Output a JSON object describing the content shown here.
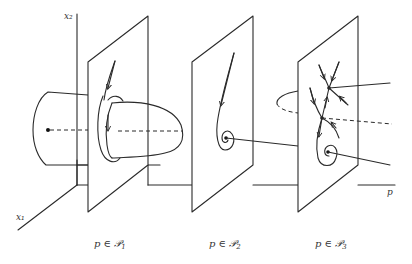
{
  "figure": {
    "type": "bifurcation-diagram",
    "axes": {
      "vertical": "x₂",
      "depth": "x₁",
      "horizontal": "p"
    },
    "panels": [
      {
        "id": "P1",
        "caption_prefix": "p ∈ ",
        "caption_set": "𝒫",
        "caption_sub": "1",
        "description": "Stable limit cycle surrounding equilibrium; paraboloid of periodic orbits"
      },
      {
        "id": "P2",
        "caption_prefix": "p ∈ ",
        "caption_set": "𝒫",
        "caption_sub": "2",
        "description": "Stable focus (spiral sink)"
      },
      {
        "id": "P3",
        "caption_prefix": "p ∈ ",
        "caption_set": "𝒫",
        "caption_sub": "3",
        "description": "Saddle points and stable focus after fold bifurcation"
      }
    ],
    "colors": {
      "ink": "#2a2a2a",
      "background": "#ffffff"
    }
  }
}
